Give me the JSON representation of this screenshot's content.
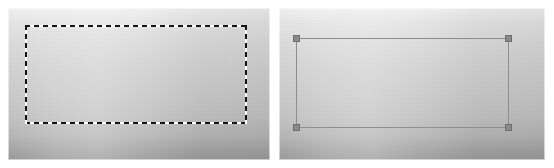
{
  "image": {
    "width": 554,
    "height": 168,
    "background_color": "#ffffff",
    "caption": "Two side-by-side image-editor canvases showing a rectangular selection: left shows an animated dashed marching-ants marquee, right shows the same selection committed as a solid outline with square corner drag handles."
  },
  "panels": [
    {
      "id": "left",
      "name": "dashed-selection-panel",
      "x": 8,
      "y": 8,
      "width": 262,
      "height": 152,
      "canvas": {
        "name": "gradient-canvas",
        "gradient_type": "vertical",
        "gradient_top_color": "#f2f2f2",
        "gradient_bottom_color": "#999999"
      },
      "selection": {
        "name": "marching-ants-marquee",
        "style": "dashed",
        "x": 17,
        "y": 17,
        "width": 222,
        "height": 99,
        "dash_color": "#141414",
        "gap_color": "#ffffff",
        "dash_length": 5,
        "gap_length": 4,
        "stroke_width": 2,
        "handles_visible": false
      }
    },
    {
      "id": "right",
      "name": "handled-selection-panel",
      "x": 279,
      "y": 8,
      "width": 266,
      "height": 152,
      "canvas": {
        "name": "gradient-canvas",
        "gradient_type": "vertical",
        "gradient_top_color": "#f2f2f2",
        "gradient_bottom_color": "#999999"
      },
      "selection": {
        "name": "transform-marquee",
        "style": "solid",
        "x": 17,
        "y": 30,
        "width": 213,
        "height": 90,
        "stroke_color": "#8e8e8e",
        "stroke_width": 1,
        "handles_visible": true,
        "handle_fill": "#8a8a8a",
        "handle_border": "#6e6e6e",
        "handle_size": 7,
        "handles": [
          {
            "name": "handle-top-left",
            "position": "top-left"
          },
          {
            "name": "handle-top-right",
            "position": "top-right"
          },
          {
            "name": "handle-bottom-left",
            "position": "bottom-left"
          },
          {
            "name": "handle-bottom-right",
            "position": "bottom-right"
          }
        ]
      }
    }
  ]
}
